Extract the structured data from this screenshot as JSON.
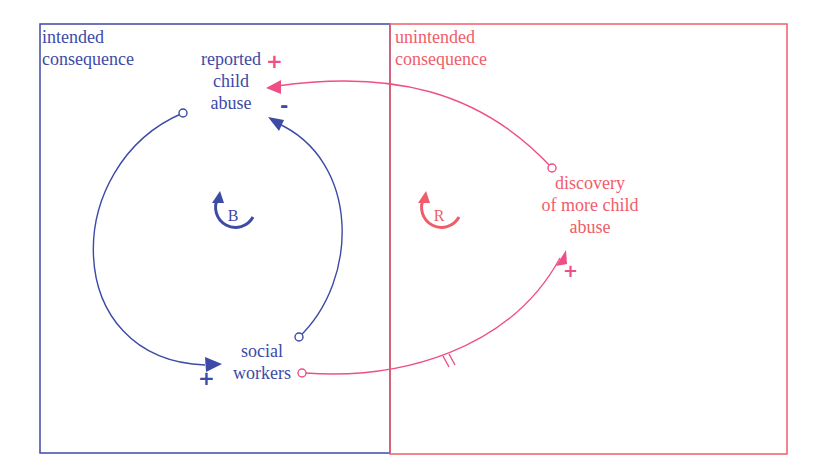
{
  "colors": {
    "intended": "#3d4aa6",
    "unintended": "#ef5d6a",
    "link_unintended": "#ef4f86"
  },
  "regions": {
    "intended": {
      "label_line1": "intended",
      "label_line2": "consequence"
    },
    "unintended": {
      "label_line1": "unintended",
      "label_line2": "consequence"
    }
  },
  "variables": {
    "reported_child_abuse": {
      "line1": "reported",
      "line2": "child",
      "line3": "abuse"
    },
    "social_workers": {
      "line1": "social",
      "line2": "workers"
    },
    "discovery": {
      "line1": "discovery",
      "line2": "of more child",
      "line3": "abuse"
    }
  },
  "loops": {
    "balancing": {
      "label": "B"
    },
    "reinforcing": {
      "label": "R"
    }
  },
  "links": [
    {
      "from": "reported child abuse",
      "to": "social workers",
      "polarity": "+",
      "delay": false
    },
    {
      "from": "social workers",
      "to": "reported child abuse",
      "polarity": "-",
      "delay": false
    },
    {
      "from": "social workers",
      "to": "discovery of more child abuse",
      "polarity": "+",
      "delay": true
    },
    {
      "from": "discovery of more child abuse",
      "to": "reported child abuse",
      "polarity": "+",
      "delay": false
    }
  ],
  "polarity": {
    "plus": "+",
    "minus": "-"
  }
}
